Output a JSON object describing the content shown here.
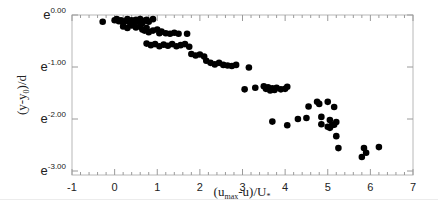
{
  "chart_data": {
    "type": "scatter",
    "title": "",
    "xlabel": "(u_max-u)/U_*",
    "ylabel": "(y-y_0)/d",
    "xlim": [
      -1,
      7
    ],
    "ylim": [
      -3.0,
      0.0
    ],
    "y_scale": "log (base e)",
    "x_ticks": [
      -1,
      0,
      1,
      2,
      3,
      4,
      5,
      6,
      7
    ],
    "x_tick_labels": [
      "-1",
      "0",
      "1",
      "2",
      "3",
      "4",
      "5",
      "6",
      "7"
    ],
    "y_ticks": [
      0.0,
      -1.0,
      -2.0,
      -3.0
    ],
    "y_tick_labels": [
      "e^0.00",
      "e^-1.00",
      "e^-2.00",
      "e^-3.00"
    ],
    "grid": false,
    "legend": null,
    "marker": "filled circle",
    "marker_color": "#000000",
    "series": [
      {
        "name": "data",
        "points": [
          [
            -0.28,
            -0.13
          ],
          [
            0.0,
            -0.1
          ],
          [
            0.05,
            -0.08
          ],
          [
            0.1,
            -0.12
          ],
          [
            0.15,
            -0.1
          ],
          [
            0.2,
            -0.15
          ],
          [
            0.25,
            -0.12
          ],
          [
            0.3,
            -0.08
          ],
          [
            0.35,
            -0.14
          ],
          [
            0.4,
            -0.1
          ],
          [
            0.45,
            -0.17
          ],
          [
            0.5,
            -0.09
          ],
          [
            0.55,
            -0.13
          ],
          [
            0.6,
            -0.08
          ],
          [
            0.65,
            -0.16
          ],
          [
            0.7,
            -0.11
          ],
          [
            0.75,
            -0.09
          ],
          [
            0.8,
            -0.13
          ],
          [
            0.9,
            -0.08
          ],
          [
            0.2,
            -0.22
          ],
          [
            0.3,
            -0.25
          ],
          [
            0.4,
            -0.2
          ],
          [
            0.5,
            -0.24
          ],
          [
            0.6,
            -0.22
          ],
          [
            0.65,
            -0.28
          ],
          [
            0.7,
            -0.3
          ],
          [
            0.75,
            -0.25
          ],
          [
            0.8,
            -0.33
          ],
          [
            0.9,
            -0.3
          ],
          [
            1.0,
            -0.28
          ],
          [
            1.05,
            -0.35
          ],
          [
            1.1,
            -0.32
          ],
          [
            1.2,
            -0.35
          ],
          [
            1.3,
            -0.36
          ],
          [
            1.4,
            -0.34
          ],
          [
            1.5,
            -0.36
          ],
          [
            1.7,
            -0.36
          ],
          [
            0.75,
            -0.55
          ],
          [
            0.85,
            -0.58
          ],
          [
            0.95,
            -0.56
          ],
          [
            1.05,
            -0.6
          ],
          [
            1.15,
            -0.57
          ],
          [
            1.25,
            -0.59
          ],
          [
            1.35,
            -0.56
          ],
          [
            1.45,
            -0.6
          ],
          [
            1.55,
            -0.58
          ],
          [
            1.65,
            -0.56
          ],
          [
            1.75,
            -0.61
          ],
          [
            1.8,
            -0.75
          ],
          [
            1.9,
            -0.78
          ],
          [
            2.0,
            -0.76
          ],
          [
            2.1,
            -0.8
          ],
          [
            2.15,
            -0.88
          ],
          [
            2.25,
            -0.92
          ],
          [
            2.35,
            -0.95
          ],
          [
            2.45,
            -0.92
          ],
          [
            2.55,
            -0.96
          ],
          [
            2.65,
            -0.97
          ],
          [
            2.75,
            -0.98
          ],
          [
            2.85,
            -0.96
          ],
          [
            3.15,
            -1.01
          ],
          [
            3.05,
            -1.43
          ],
          [
            3.3,
            -1.4
          ],
          [
            3.5,
            -1.37
          ],
          [
            3.55,
            -1.42
          ],
          [
            3.6,
            -1.39
          ],
          [
            3.65,
            -1.45
          ],
          [
            3.7,
            -1.41
          ],
          [
            3.75,
            -1.44
          ],
          [
            3.8,
            -1.4
          ],
          [
            3.9,
            -1.43
          ],
          [
            4.0,
            -1.42
          ],
          [
            4.05,
            -1.38
          ],
          [
            3.7,
            -2.05
          ],
          [
            4.05,
            -2.12
          ],
          [
            4.3,
            -2.0
          ],
          [
            4.5,
            -1.98
          ],
          [
            4.55,
            -1.76
          ],
          [
            4.75,
            -1.67
          ],
          [
            4.8,
            -1.71
          ],
          [
            5.0,
            -1.67
          ],
          [
            5.15,
            -1.77
          ],
          [
            4.85,
            -2.1
          ],
          [
            4.85,
            -1.96
          ],
          [
            5.05,
            -2.02
          ],
          [
            5.0,
            -2.15
          ],
          [
            5.05,
            -2.17
          ],
          [
            5.1,
            -2.12
          ],
          [
            5.15,
            -2.11
          ],
          [
            5.2,
            -2.06
          ],
          [
            5.2,
            -2.33
          ],
          [
            5.25,
            -2.56
          ],
          [
            5.85,
            -2.56
          ],
          [
            5.9,
            -2.65
          ],
          [
            5.8,
            -2.73
          ],
          [
            6.2,
            -2.54
          ]
        ]
      }
    ]
  },
  "axes": {
    "x_title_main": "(u",
    "x_title_sub": "max",
    "x_title_rest": "-u)/U",
    "x_title_sub2": "*",
    "y_title_main": "(y-y",
    "y_title_sub": "0",
    "y_title_rest": ")/d"
  }
}
